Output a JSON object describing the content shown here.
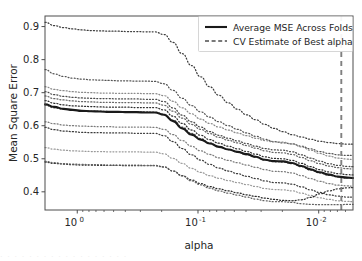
{
  "chart_data": {
    "type": "line",
    "title": "",
    "xlabel": "alpha",
    "ylabel": "Mean Square Error",
    "x_scale": "log",
    "x_inverted": true,
    "xlim": [
      1.85,
      0.0052
    ],
    "ylim": [
      0.345,
      0.932
    ],
    "grid": false,
    "legend_position": "upper right",
    "y_ticks": [
      "0.4",
      "0.5",
      "0.6",
      "0.7",
      "0.8",
      "0.9"
    ],
    "y_tick_values": [
      0.4,
      0.5,
      0.6,
      0.7,
      0.8,
      0.9
    ],
    "x_ticks": [
      {
        "mantissa": "10",
        "exponent": "0",
        "value": 1.0
      },
      {
        "mantissa": "10",
        "exponent": "-1",
        "value": 0.1
      },
      {
        "mantissa": "10",
        "exponent": "-2",
        "value": 0.01
      }
    ],
    "annotations": [
      {
        "name": "cv-best-alpha",
        "type": "vline",
        "x": 0.0065,
        "style": "dashed",
        "color": "#808080"
      }
    ],
    "legend": [
      {
        "label": "Average MSE Across Folds",
        "style": "solid",
        "color": "#1a1a1a",
        "width": 2.1
      },
      {
        "label": "CV Estimate of Best alpha",
        "style": "dashed",
        "color": "#4d4d4d",
        "width": 1.3
      }
    ],
    "x": [
      1.85,
      1.55,
      1.3,
      1.09,
      0.92,
      0.77,
      0.65,
      0.545,
      0.458,
      0.385,
      0.323,
      0.271,
      0.228,
      0.191,
      0.161,
      0.135,
      0.113,
      0.095,
      0.08,
      0.067,
      0.056,
      0.047,
      0.0396,
      0.0332,
      0.0279,
      0.0235,
      0.0197,
      0.0166,
      0.0139,
      0.0117,
      0.0098,
      0.0082,
      0.0069,
      0.0058,
      0.0052
    ],
    "series": [
      {
        "name": "Average MSE Across Folds",
        "style": "solid",
        "color": "#1a1a1a",
        "values": [
          0.665,
          0.657,
          0.651,
          0.648,
          0.645,
          0.644,
          0.643,
          0.642,
          0.642,
          0.641,
          0.641,
          0.64,
          0.64,
          0.633,
          0.614,
          0.592,
          0.573,
          0.558,
          0.546,
          0.536,
          0.528,
          0.521,
          0.514,
          0.506,
          0.497,
          0.493,
          0.492,
          0.487,
          0.478,
          0.468,
          0.459,
          0.452,
          0.446,
          0.443,
          0.442
        ]
      },
      {
        "name": "fold-1",
        "style": "dotted",
        "color": "#3d3d3d",
        "values": [
          0.913,
          0.903,
          0.897,
          0.893,
          0.89,
          0.888,
          0.887,
          0.886,
          0.886,
          0.885,
          0.885,
          0.884,
          0.884,
          0.876,
          0.852,
          0.818,
          0.782,
          0.748,
          0.718,
          0.692,
          0.669,
          0.65,
          0.633,
          0.618,
          0.604,
          0.592,
          0.582,
          0.573,
          0.566,
          0.559,
          0.553,
          0.549,
          0.546,
          0.544,
          0.544
        ]
      },
      {
        "name": "fold-2",
        "style": "dotted",
        "color": "#555555",
        "values": [
          0.77,
          0.757,
          0.749,
          0.744,
          0.741,
          0.739,
          0.738,
          0.737,
          0.736,
          0.736,
          0.735,
          0.735,
          0.734,
          0.727,
          0.707,
          0.683,
          0.661,
          0.642,
          0.626,
          0.612,
          0.6,
          0.589,
          0.578,
          0.568,
          0.559,
          0.552,
          0.548,
          0.545,
          0.538,
          0.53,
          0.522,
          0.516,
          0.512,
          0.51,
          0.51
        ]
      },
      {
        "name": "fold-3",
        "style": "dotted",
        "color": "#8a8a8a",
        "values": [
          0.718,
          0.71,
          0.706,
          0.703,
          0.701,
          0.7,
          0.699,
          0.699,
          0.698,
          0.698,
          0.698,
          0.697,
          0.697,
          0.691,
          0.674,
          0.654,
          0.636,
          0.62,
          0.607,
          0.596,
          0.587,
          0.578,
          0.57,
          0.562,
          0.555,
          0.551,
          0.55,
          0.545,
          0.536,
          0.526,
          0.516,
          0.508,
          0.502,
          0.499,
          0.498
        ]
      },
      {
        "name": "fold-4",
        "style": "dotted",
        "color": "#4a4a4a",
        "values": [
          0.703,
          0.694,
          0.689,
          0.686,
          0.684,
          0.683,
          0.682,
          0.682,
          0.681,
          0.681,
          0.681,
          0.68,
          0.68,
          0.673,
          0.654,
          0.632,
          0.612,
          0.596,
          0.582,
          0.571,
          0.562,
          0.554,
          0.546,
          0.538,
          0.531,
          0.527,
          0.526,
          0.521,
          0.512,
          0.502,
          0.493,
          0.485,
          0.48,
          0.477,
          0.476
        ]
      },
      {
        "name": "fold-5",
        "style": "dotted",
        "color": "#666666",
        "values": [
          0.69,
          0.682,
          0.678,
          0.675,
          0.673,
          0.672,
          0.671,
          0.671,
          0.67,
          0.67,
          0.67,
          0.669,
          0.669,
          0.662,
          0.644,
          0.623,
          0.604,
          0.589,
          0.576,
          0.565,
          0.556,
          0.548,
          0.54,
          0.532,
          0.524,
          0.519,
          0.518,
          0.513,
          0.504,
          0.494,
          0.485,
          0.478,
          0.473,
          0.47,
          0.469
        ]
      },
      {
        "name": "fold-6",
        "style": "dotted",
        "color": "#2e2e2e",
        "values": [
          0.676,
          0.668,
          0.663,
          0.66,
          0.659,
          0.658,
          0.657,
          0.656,
          0.656,
          0.656,
          0.655,
          0.655,
          0.655,
          0.648,
          0.629,
          0.607,
          0.587,
          0.571,
          0.558,
          0.547,
          0.538,
          0.53,
          0.522,
          0.514,
          0.506,
          0.501,
          0.5,
          0.495,
          0.486,
          0.476,
          0.467,
          0.46,
          0.455,
          0.452,
          0.451
        ]
      },
      {
        "name": "fold-7",
        "style": "dotted",
        "color": "#5c5c5c",
        "values": [
          0.662,
          0.654,
          0.65,
          0.647,
          0.645,
          0.644,
          0.644,
          0.643,
          0.643,
          0.642,
          0.642,
          0.642,
          0.641,
          0.635,
          0.617,
          0.596,
          0.577,
          0.561,
          0.548,
          0.537,
          0.528,
          0.52,
          0.512,
          0.504,
          0.496,
          0.491,
          0.49,
          0.485,
          0.476,
          0.466,
          0.457,
          0.45,
          0.445,
          0.442,
          0.441
        ]
      },
      {
        "name": "fold-8",
        "style": "dotted",
        "color": "#7a7a7a",
        "values": [
          0.612,
          0.606,
          0.602,
          0.6,
          0.599,
          0.598,
          0.597,
          0.597,
          0.596,
          0.596,
          0.596,
          0.596,
          0.595,
          0.589,
          0.573,
          0.555,
          0.538,
          0.524,
          0.513,
          0.503,
          0.495,
          0.488,
          0.481,
          0.474,
          0.467,
          0.462,
          0.461,
          0.457,
          0.449,
          0.44,
          0.432,
          0.425,
          0.42,
          0.418,
          0.417
        ]
      },
      {
        "name": "fold-9",
        "style": "dotted",
        "color": "#3a3a3a",
        "values": [
          0.595,
          0.588,
          0.584,
          0.582,
          0.58,
          0.579,
          0.579,
          0.578,
          0.578,
          0.578,
          0.577,
          0.577,
          0.577,
          0.57,
          0.552,
          0.531,
          0.512,
          0.496,
          0.483,
          0.472,
          0.463,
          0.455,
          0.447,
          0.44,
          0.433,
          0.428,
          0.427,
          0.423,
          0.415,
          0.406,
          0.398,
          0.391,
          0.387,
          0.384,
          0.384
        ]
      },
      {
        "name": "fold-10",
        "style": "dotted",
        "color": "#9a9a9a",
        "values": [
          0.534,
          0.529,
          0.526,
          0.524,
          0.523,
          0.522,
          0.522,
          0.521,
          0.521,
          0.521,
          0.521,
          0.52,
          0.52,
          0.515,
          0.501,
          0.486,
          0.471,
          0.459,
          0.449,
          0.441,
          0.434,
          0.428,
          0.422,
          0.416,
          0.41,
          0.407,
          0.406,
          0.403,
          0.396,
          0.389,
          0.382,
          0.377,
          0.373,
          0.371,
          0.37
        ]
      },
      {
        "name": "fold-11",
        "style": "dotted",
        "color": "#2b2b2b",
        "values": [
          0.49,
          0.486,
          0.484,
          0.482,
          0.481,
          0.481,
          0.48,
          0.48,
          0.48,
          0.479,
          0.479,
          0.479,
          0.479,
          0.475,
          0.463,
          0.449,
          0.436,
          0.425,
          0.416,
          0.409,
          0.403,
          0.397,
          0.391,
          0.386,
          0.381,
          0.377,
          0.374,
          0.373,
          0.376,
          0.383,
          0.394,
          0.403,
          0.409,
          0.412,
          0.413
        ]
      },
      {
        "name": "fold-12",
        "style": "dotted",
        "color": "#626262",
        "values": [
          0.492,
          0.488,
          0.485,
          0.484,
          0.483,
          0.482,
          0.482,
          0.481,
          0.481,
          0.481,
          0.481,
          0.48,
          0.48,
          0.476,
          0.463,
          0.448,
          0.433,
          0.421,
          0.411,
          0.403,
          0.396,
          0.39,
          0.384,
          0.378,
          0.373,
          0.37,
          0.37,
          0.368,
          0.364,
          0.362,
          0.361,
          0.361,
          0.361,
          0.362,
          0.362
        ]
      }
    ]
  },
  "figure": {
    "ghost_text": "· · · · · · · · · · · · · · · · · ·"
  }
}
